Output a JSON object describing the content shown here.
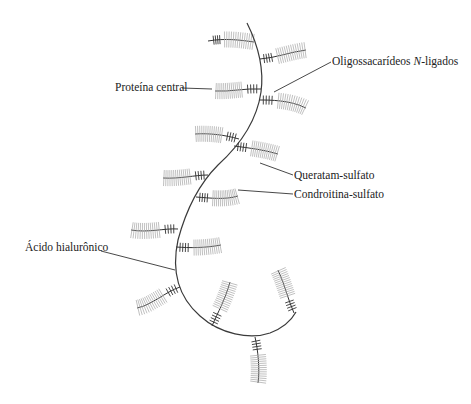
{
  "diagram": {
    "colors": {
      "line": "#333333",
      "gag_chain": "#b0b0b0",
      "background": "#ffffff"
    },
    "labels": [
      {
        "id": "oligo",
        "text": "Oligossacarídeos ",
        "italic": "N",
        "suffix": "-ligados",
        "x": 332,
        "y": 56
      },
      {
        "id": "proteina",
        "text": "Proteína central",
        "x": 115,
        "y": 82
      },
      {
        "id": "queratam",
        "text": "Queratam-sulfato",
        "x": 294,
        "y": 170
      },
      {
        "id": "condroitina",
        "text": "Condroitina-sulfato",
        "x": 294,
        "y": 189
      },
      {
        "id": "hialuronico",
        "text": "Ácido hialurônico",
        "x": 25,
        "y": 242
      }
    ],
    "leaders": [
      {
        "id": "oligo",
        "d": "M331,62 L274,92"
      },
      {
        "id": "proteina",
        "d": "M182,88 L212,89"
      },
      {
        "id": "queratam",
        "d": "M260,163 L293,175"
      },
      {
        "id": "condroitina",
        "d": "M238,190 L293,194"
      },
      {
        "id": "hialuronico",
        "d": "M101,251 L175,270"
      }
    ],
    "spine": "M247,23 C258,45 264,70 261,92 C257,120 240,145 218,165 C198,185 186,210 178,240 C172,268 176,295 200,316 C220,334 250,340 270,333 C283,328 291,321 296,312",
    "branches": [
      {
        "name": "branch-1",
        "d": "M254,42 C240,40 225,38 208,41",
        "ticks": 18,
        "dark_start": 0.72
      },
      {
        "name": "branch-2",
        "d": "M260,59 C275,58 290,52 306,50",
        "ticks": 18,
        "dark_start": 0.0,
        "dark_end": 0.28
      },
      {
        "name": "branch-3",
        "d": "M261,89 C245,88 230,92 215,91",
        "ticks": 18,
        "dark_start": 0.0,
        "dark_end": 0.32
      },
      {
        "name": "branch-4",
        "d": "M259,100 C270,100 290,100 306,108",
        "ticks": 18,
        "dark_start": 0.0,
        "dark_end": 0.3
      },
      {
        "name": "branch-5",
        "d": "M239,139 C225,135 210,133 195,134",
        "ticks": 18,
        "dark_start": 0.0,
        "dark_end": 0.3
      },
      {
        "name": "branch-6",
        "d": "M234,146 C250,148 265,150 278,154",
        "ticks": 18,
        "dark_start": 0.0,
        "dark_end": 0.3
      },
      {
        "name": "branch-7",
        "d": "M208,175 C195,175 180,179 163,178",
        "ticks": 18,
        "dark_start": 0.0,
        "dark_end": 0.3
      },
      {
        "name": "branch-8",
        "d": "M196,197 C210,198 225,200 238,196",
        "ticks": 18,
        "dark_start": 0.0,
        "dark_end": 0.3
      },
      {
        "name": "branch-9",
        "d": "M178,229 C165,228 148,233 131,230",
        "ticks": 18,
        "dark_start": 0.0,
        "dark_end": 0.3
      },
      {
        "name": "branch-10",
        "d": "M176,247 C190,248 205,248 221,245",
        "ticks": 18,
        "dark_start": 0.0,
        "dark_end": 0.3
      },
      {
        "name": "branch-11",
        "d": "M180,287 C165,292 152,305 137,308",
        "ticks": 18,
        "dark_start": 0.0,
        "dark_end": 0.3
      },
      {
        "name": "branch-12",
        "d": "M212,326 C218,312 225,300 230,282",
        "ticks": 18,
        "dark_start": 0.0,
        "dark_end": 0.3
      },
      {
        "name": "branch-13",
        "d": "M294,313 C288,300 285,285 278,270",
        "ticks": 18,
        "dark_start": 0.0,
        "dark_end": 0.3
      },
      {
        "name": "branch-14",
        "d": "M255,337 C258,350 260,370 258,383",
        "ticks": 18,
        "dark_start": 0.0,
        "dark_end": 0.3
      }
    ]
  }
}
